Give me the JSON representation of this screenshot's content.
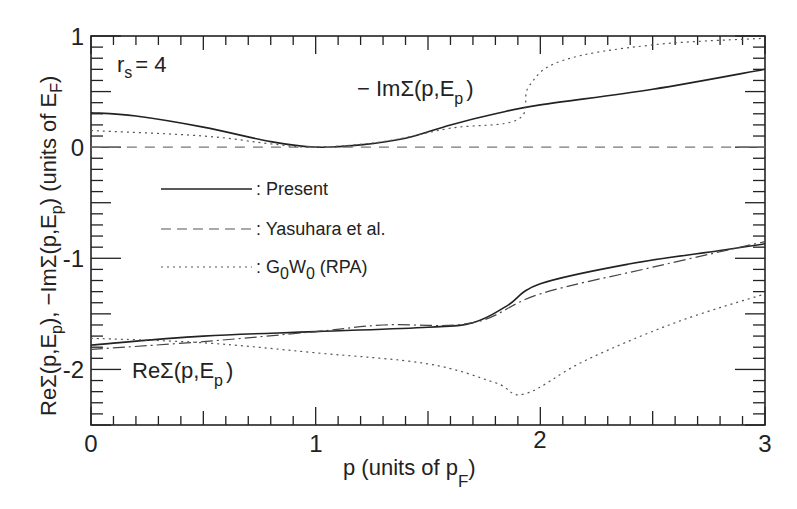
{
  "chart_data": {
    "type": "line",
    "title": "",
    "annotation_param": "r_s = 4",
    "xlabel": "p (units of p_F)",
    "ylabel": "ReΣ(p,E_p), −ImΣ(p,E_p) (units of E_F)",
    "xlim": [
      0,
      3
    ],
    "ylim": [
      -2.5,
      1
    ],
    "x_ticks": [
      0,
      1,
      2,
      3
    ],
    "y_ticks": [
      1,
      0,
      -1,
      -2
    ],
    "x_tick_labels": [
      "0",
      "1",
      "2",
      "3"
    ],
    "y_tick_labels": [
      "1",
      "0",
      "-1",
      "-2"
    ],
    "grid": false,
    "legend_position": "center-left",
    "curve_labels": {
      "im": "− ImΣ(p,E_p)",
      "re": "ReΣ(p,E_p)"
    },
    "series": [
      {
        "name": "Present",
        "component": "-Im",
        "style": "solid",
        "x": [
          0,
          0.2,
          0.5,
          0.8,
          1.0,
          1.2,
          1.4,
          1.6,
          1.8,
          2.0,
          2.5,
          3.0
        ],
        "y": [
          0.31,
          0.28,
          0.18,
          0.05,
          0.0,
          0.02,
          0.08,
          0.2,
          0.3,
          0.38,
          0.52,
          0.7
        ]
      },
      {
        "name": "Yasuhara et al.",
        "component": "-Im",
        "style": "dashed",
        "x": [
          0,
          3
        ],
        "y": [
          0,
          0
        ]
      },
      {
        "name": "G0W0 (RPA)",
        "component": "-Im",
        "style": "dotted",
        "x": [
          0,
          0.5,
          0.8,
          1.0,
          1.3,
          1.6,
          1.9,
          1.95,
          2.1,
          2.5,
          3.0
        ],
        "y": [
          0.15,
          0.1,
          0.03,
          0.0,
          0.05,
          0.17,
          0.25,
          0.55,
          0.78,
          0.92,
          0.98
        ]
      },
      {
        "name": "Present",
        "component": "Re",
        "style": "solid",
        "x": [
          0,
          0.5,
          1.0,
          1.5,
          1.7,
          1.85,
          2.0,
          2.4,
          2.8,
          3.0
        ],
        "y": [
          -1.78,
          -1.7,
          -1.66,
          -1.62,
          -1.58,
          -1.43,
          -1.23,
          -1.05,
          -0.93,
          -0.87
        ]
      },
      {
        "name": "Yasuhara et al.",
        "component": "Re",
        "style": "dash-dot",
        "x": [
          0,
          0.5,
          1.0,
          1.3,
          1.7,
          2.0,
          2.5,
          3.0
        ],
        "y": [
          -1.82,
          -1.75,
          -1.66,
          -1.6,
          -1.58,
          -1.32,
          -1.08,
          -0.85
        ]
      },
      {
        "name": "G0W0 (RPA)",
        "component": "Re",
        "style": "dotted",
        "x": [
          0,
          0.5,
          1.0,
          1.5,
          1.8,
          1.93,
          2.2,
          2.6,
          3.0
        ],
        "y": [
          -1.72,
          -1.76,
          -1.85,
          -1.95,
          -2.12,
          -2.22,
          -1.92,
          -1.58,
          -1.32
        ]
      }
    ],
    "legend": [
      {
        "label": ": Present",
        "style": "solid"
      },
      {
        "label": ": Yasuhara et al.",
        "style": "dashed"
      },
      {
        "label": ": G0W0 (RPA)",
        "style": "dotted"
      }
    ]
  },
  "text": {
    "rs_label": "r",
    "rs_sub": "s",
    "rs_value": "= 4",
    "im_label_main": "− ImΣ(p,E",
    "im_label_sub": "p",
    "im_label_end": ")",
    "re_label_main": "ReΣ(p,E",
    "re_label_sub": "p",
    "re_label_end": ")",
    "xlabel_main": "p (units of p",
    "xlabel_sub": "F",
    "xlabel_end": ")",
    "ylabel_a": "ReΣ(p,E",
    "ylabel_a_sub": "p",
    "ylabel_b": "), −ImΣ(p,E",
    "ylabel_b_sub": "p",
    "ylabel_c": ") (units of E",
    "ylabel_c_sub": "F",
    "ylabel_d": ")",
    "legend_present": ": Present",
    "legend_yasuhara": ": Yasuhara et al.",
    "legend_g": ": G",
    "legend_g_sub1": "0",
    "legend_w": "W",
    "legend_w_sub": "0",
    "legend_rpa": " (RPA)",
    "tick_x0": "0",
    "tick_x1": "1",
    "tick_x2": "2",
    "tick_x3": "3",
    "tick_y1": "1",
    "tick_y0": "0",
    "tick_ym1": "-1",
    "tick_ym2": "-2"
  }
}
